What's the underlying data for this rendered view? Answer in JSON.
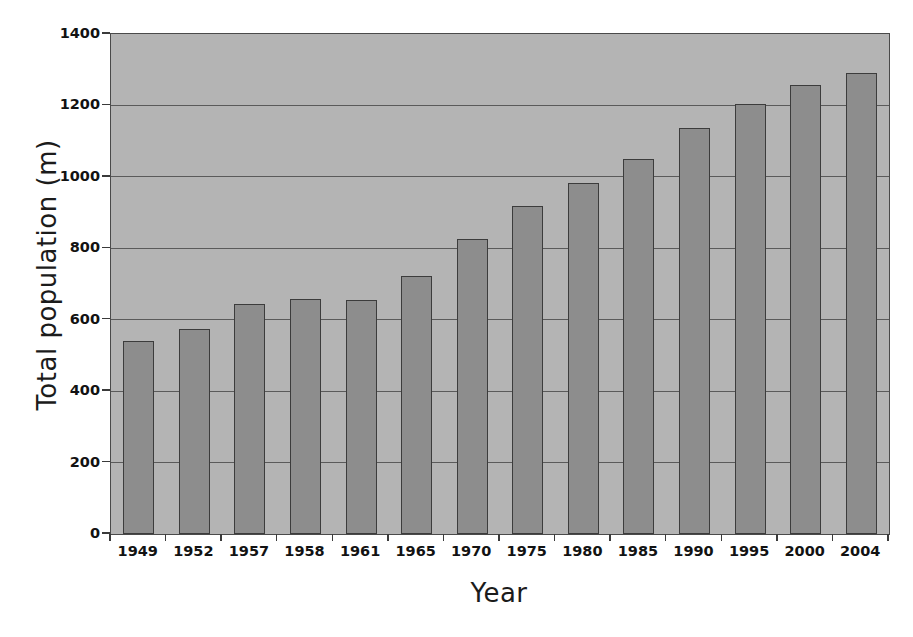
{
  "chart_data": {
    "type": "bar",
    "title": "",
    "xlabel": "Year",
    "ylabel": "Total population (m)",
    "categories": [
      "1949",
      "1952",
      "1957",
      "1958",
      "1961",
      "1965",
      "1970",
      "1975",
      "1980",
      "1985",
      "1990",
      "1995",
      "2000",
      "2004"
    ],
    "values": [
      540,
      575,
      645,
      658,
      656,
      722,
      825,
      918,
      982,
      1050,
      1138,
      1205,
      1258,
      1292
    ],
    "ylim": [
      0,
      1400
    ],
    "ytick_values": [
      0,
      200,
      400,
      600,
      800,
      1000,
      1200,
      1400
    ],
    "ytick_labels": [
      "0",
      "200",
      "400",
      "600",
      "800",
      "1000",
      "1200",
      "1400"
    ],
    "grid": "horizontal",
    "legend": "none",
    "series": [
      {
        "name": "Total population (m)",
        "values": [
          540,
          575,
          645,
          658,
          656,
          722,
          825,
          918,
          982,
          1050,
          1138,
          1205,
          1258,
          1292
        ]
      }
    ],
    "colors": {
      "bar_fill": "#8d8d8d",
      "bar_edge": "#3c3c3c",
      "plot_background": "#b4b4b4",
      "gridline": "#5a5a5a",
      "axis": "#4a4a4a",
      "text": "#121212",
      "figure_background": "#ffffff"
    }
  }
}
